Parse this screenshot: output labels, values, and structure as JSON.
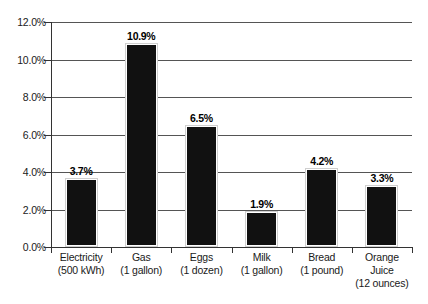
{
  "chart_data": {
    "type": "bar",
    "title": "",
    "subtitle": "",
    "xlabel": "",
    "ylabel": "",
    "categories": [
      "Electricity (500 kWh)",
      "Gas (1 gallon)",
      "Eggs (1 dozen)",
      "Milk (1 gallon)",
      "Bread (1 pound)",
      "Orange Juice (12 ounces)"
    ],
    "category_lines": [
      [
        "Electricity",
        "(500 kWh)"
      ],
      [
        "Gas",
        "(1 gallon)"
      ],
      [
        "Eggs",
        "(1 dozen)"
      ],
      [
        "Milk",
        "(1 gallon)"
      ],
      [
        "Bread",
        "(1 pound)"
      ],
      [
        "Orange",
        "Juice",
        "(12 ounces)"
      ]
    ],
    "values": [
      3.7,
      10.9,
      6.5,
      1.9,
      4.2,
      3.3
    ],
    "data_labels": [
      "3.7%",
      "10.9%",
      "6.5%",
      "1.9%",
      "4.2%",
      "3.3%"
    ],
    "ylim": [
      0,
      12
    ],
    "ytick_values": [
      0.0,
      2.0,
      4.0,
      6.0,
      8.0,
      10.0,
      12.0
    ],
    "ytick_labels": [
      "0.0%",
      "2.0%",
      "4.0%",
      "6.0%",
      "8.0%",
      "10.0%",
      "12.0%"
    ],
    "grid": true,
    "legend": "none",
    "bar_color": "#111111",
    "gridline_color": "#555555",
    "axis_color": "#333333",
    "background_color": "#ffffff"
  }
}
